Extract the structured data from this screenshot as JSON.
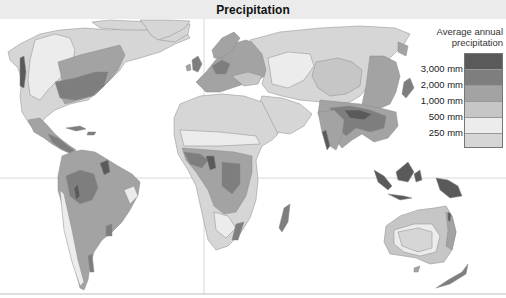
{
  "title": "Precipitation",
  "legend": {
    "title_line1": "Average annual",
    "title_line2": "precipitation",
    "classes": [
      {
        "label": "3,000 mm",
        "color": "#5a5a5a"
      },
      {
        "label": "2,000 mm",
        "color": "#7e7e7e"
      },
      {
        "label": "1,000 mm",
        "color": "#a3a3a3"
      },
      {
        "label": "500 mm",
        "color": "#c6c6c6"
      },
      {
        "label": "250 mm",
        "color": "#ececec"
      },
      {
        "label": "",
        "color": "#d6d6d6"
      }
    ]
  },
  "map": {
    "gridlines": [
      "equator",
      "prime-meridian"
    ],
    "colors": {
      "ocean": "#ffffff",
      "grid": "#c8c8c8",
      "coast": "#8a8a8a"
    }
  }
}
